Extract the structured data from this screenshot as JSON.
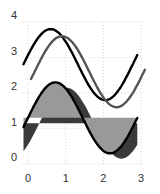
{
  "chart_data": {
    "type": "area",
    "title": "",
    "xlabel": "",
    "ylabel": "",
    "xlim": [
      -0.15,
      3.1
    ],
    "ylim": [
      0,
      4
    ],
    "grid": true,
    "legend": null,
    "x_ticks": [
      "0",
      "1",
      "2",
      "3"
    ],
    "y_ticks": [
      "0",
      "1",
      "2",
      "3",
      "4"
    ],
    "period": 2.9,
    "series": [
      {
        "name": "top-line-black",
        "kind": "line",
        "color": "#000000",
        "center": 2.8,
        "amplitude": 1.0,
        "phase": 0.27,
        "x_start": -0.12,
        "x_end": 2.9,
        "dx": 0,
        "dy": 0
      },
      {
        "name": "top-line-gray",
        "kind": "line",
        "color": "#555555",
        "center": 2.8,
        "amplitude": 1.0,
        "phase": 0.27,
        "x_start": 0.08,
        "x_end": 3.1,
        "dx": 0.3,
        "dy": -0.2
      },
      {
        "name": "filled-shadow",
        "kind": "area",
        "color": "#3a3a3a",
        "center": 1.3,
        "amplitude": 1.0,
        "phase": 0.0,
        "x_start": -0.12,
        "x_end": 2.9,
        "dx": 0.3,
        "dy": -0.15
      },
      {
        "name": "filled-main",
        "kind": "area",
        "color": "#999999",
        "stroke": "#000000",
        "center": 1.3,
        "amplitude": 1.0,
        "phase": 0.0,
        "x_start": -0.12,
        "x_end": 2.9,
        "dx": 0,
        "dy": 0
      }
    ],
    "sample_points": {
      "top-line-black": [
        [
          0,
          3.07
        ],
        [
          0.6,
          3.8
        ],
        [
          1.35,
          2.8
        ],
        [
          2.05,
          1.8
        ],
        [
          2.9,
          3.0
        ]
      ],
      "filled-main": [
        [
          0,
          1.3
        ],
        [
          0.72,
          2.3
        ],
        [
          1.45,
          1.3
        ],
        [
          2.17,
          0.3
        ],
        [
          2.9,
          1.3
        ]
      ]
    }
  }
}
